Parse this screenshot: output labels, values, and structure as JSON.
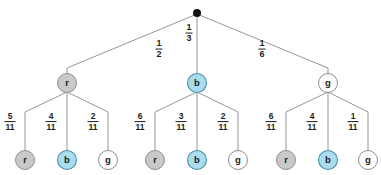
{
  "diagram": {
    "type": "probability-tree",
    "title": "",
    "root": {
      "label": "",
      "style": "dot"
    },
    "level1": {
      "nodes": [
        {
          "label": "r",
          "style": "gray"
        },
        {
          "label": "b",
          "style": "blue"
        },
        {
          "label": "g",
          "style": "white"
        }
      ],
      "probabilities": [
        {
          "numerator": "1",
          "denominator": "2"
        },
        {
          "numerator": "1",
          "denominator": "3"
        },
        {
          "numerator": "1",
          "denominator": "6"
        }
      ]
    },
    "level2": {
      "groups": [
        {
          "parent": "r",
          "nodes": [
            {
              "label": "r",
              "style": "gray"
            },
            {
              "label": "b",
              "style": "blue"
            },
            {
              "label": "g",
              "style": "white"
            }
          ],
          "probabilities": [
            {
              "numerator": "5",
              "denominator": "11"
            },
            {
              "numerator": "4",
              "denominator": "11"
            },
            {
              "numerator": "2",
              "denominator": "11"
            }
          ]
        },
        {
          "parent": "b",
          "nodes": [
            {
              "label": "r",
              "style": "gray"
            },
            {
              "label": "b",
              "style": "blue"
            },
            {
              "label": "g",
              "style": "white"
            }
          ],
          "probabilities": [
            {
              "numerator": "6",
              "denominator": "11"
            },
            {
              "numerator": "3",
              "denominator": "11"
            },
            {
              "numerator": "2",
              "denominator": "11"
            }
          ]
        },
        {
          "parent": "g",
          "nodes": [
            {
              "label": "r",
              "style": "gray"
            },
            {
              "label": "b",
              "style": "blue"
            },
            {
              "label": "g",
              "style": "white"
            }
          ],
          "probabilities": [
            {
              "numerator": "6",
              "denominator": "11"
            },
            {
              "numerator": "4",
              "denominator": "11"
            },
            {
              "numerator": "1",
              "denominator": "11"
            }
          ]
        }
      ]
    },
    "colors": {
      "gray_fill": "#c9c9c9",
      "gray_stroke": "#8d8d8d",
      "blue_fill": "#a9dcec",
      "blue_stroke": "#4a8fa8",
      "white_fill": "#ffffff",
      "edge": "#8a8a8a",
      "root_dot": "#111111",
      "text": "#1d1d1d",
      "background": "#ffffff"
    }
  }
}
